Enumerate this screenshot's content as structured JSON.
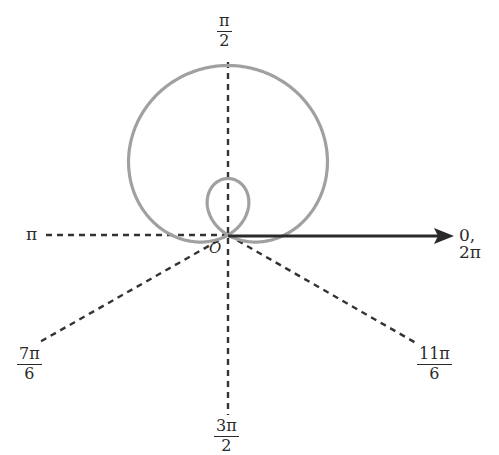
{
  "diagram": {
    "type": "polar-graph",
    "curve": "limacon with inner loop",
    "colors": {
      "curve": "#a0a0a0",
      "axis_dashed": "#333333",
      "polar_axis": "#2a2a2a",
      "text": "#2a2a2a"
    },
    "labels": {
      "origin": "O",
      "polar_axis": "0, 2π",
      "pi": "π",
      "pi_over_2": {
        "num": "π",
        "den": "2"
      },
      "seven_pi_over_6": {
        "num": "7π",
        "den": "6"
      },
      "eleven_pi_over_6": {
        "num": "11π",
        "den": "6"
      },
      "three_pi_over_2": {
        "num": "3π",
        "den": "2"
      }
    }
  }
}
